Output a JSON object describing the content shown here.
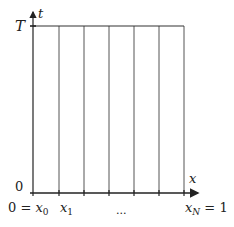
{
  "diagram": {
    "axes": {
      "t_axis": {
        "label": "t"
      },
      "x_axis": {
        "label": "x"
      }
    },
    "labels": {
      "top": "T",
      "origin": "0",
      "x0": "0 = x",
      "x0_sub": "0",
      "x1": "x",
      "x1_sub": "1",
      "dots": "...",
      "xN": "x",
      "xN_sub": "N",
      "xN_eq": " = 1"
    },
    "grid": {
      "num_vertical_lines": 7,
      "line_color": "#444444"
    }
  }
}
